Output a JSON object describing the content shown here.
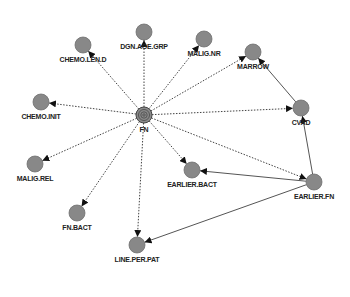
{
  "diagram": {
    "type": "directed-network",
    "colors": {
      "background": "#ffffff",
      "node_fill": "#888888",
      "node_stroke": "#6e6e6e",
      "edge": "#444444",
      "label": "#222222"
    },
    "nodes": [
      {
        "id": "FN",
        "label": "FN",
        "x": 144,
        "y": 115,
        "central": true
      },
      {
        "id": "CHEMO.LEN.D",
        "label": "CHEMO.LEN.D",
        "x": 83,
        "y": 45
      },
      {
        "id": "DGN.AGE.GRP",
        "label": "DGN.AGE.GRP",
        "x": 144,
        "y": 32
      },
      {
        "id": "MALIG.NR",
        "label": "MALIG.NR",
        "x": 204,
        "y": 39
      },
      {
        "id": "MARROW",
        "label": "MARROW",
        "x": 253,
        "y": 52
      },
      {
        "id": "CHEMO.INIT",
        "label": "CHEMO.INIT",
        "x": 41,
        "y": 102
      },
      {
        "id": "CVAD",
        "label": "CVAD",
        "x": 301,
        "y": 108
      },
      {
        "id": "MALIG.REL",
        "label": "MALIG.REL",
        "x": 35,
        "y": 164
      },
      {
        "id": "EARLIER.BACT",
        "label": "EARLIER.BACT",
        "x": 192,
        "y": 170
      },
      {
        "id": "EARLIER.FN",
        "label": "EARLIER.FN",
        "x": 314,
        "y": 182
      },
      {
        "id": "FN.BACT",
        "label": "FN.BACT",
        "x": 77,
        "y": 213
      },
      {
        "id": "LINE.PER.PAT",
        "label": "LINE.PER.PAT",
        "x": 137,
        "y": 245
      }
    ],
    "edges": [
      {
        "from": "FN",
        "to": "CHEMO.LEN.D",
        "style": "dotted"
      },
      {
        "from": "FN",
        "to": "DGN.AGE.GRP",
        "style": "dotted"
      },
      {
        "from": "FN",
        "to": "MALIG.NR",
        "style": "dotted"
      },
      {
        "from": "FN",
        "to": "MARROW",
        "style": "dotted"
      },
      {
        "from": "FN",
        "to": "CHEMO.INIT",
        "style": "dotted"
      },
      {
        "from": "FN",
        "to": "CVAD",
        "style": "dotted"
      },
      {
        "from": "FN",
        "to": "MALIG.REL",
        "style": "dotted"
      },
      {
        "from": "FN",
        "to": "EARLIER.BACT",
        "style": "dotted"
      },
      {
        "from": "FN",
        "to": "EARLIER.FN",
        "style": "dotted"
      },
      {
        "from": "FN",
        "to": "FN.BACT",
        "style": "dotted"
      },
      {
        "from": "FN",
        "to": "LINE.PER.PAT",
        "style": "dotted"
      },
      {
        "from": "CVAD",
        "to": "MARROW",
        "style": "solid"
      },
      {
        "from": "EARLIER.FN",
        "to": "CVAD",
        "style": "solid"
      },
      {
        "from": "EARLIER.FN",
        "to": "EARLIER.BACT",
        "style": "solid"
      },
      {
        "from": "EARLIER.FN",
        "to": "LINE.PER.PAT",
        "style": "solid"
      }
    ]
  }
}
